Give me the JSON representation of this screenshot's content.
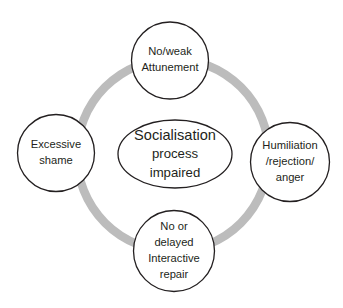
{
  "diagram": {
    "type": "cycle-diagram",
    "colors": {
      "ring": "#bcbcbc",
      "node_stroke": "#231f20",
      "node_fill": "#ffffff",
      "text": "#231f20",
      "background": "#ffffff"
    },
    "center": {
      "name": "socialisation-process-impaired",
      "shape": "ellipse",
      "lines": [
        "Socialisation",
        "process",
        "impaired"
      ]
    },
    "nodes": [
      {
        "id": "top",
        "name": "no-weak-attunement",
        "shape": "circle",
        "lines": [
          "No/weak",
          "Attunement"
        ]
      },
      {
        "id": "right",
        "name": "humiliation-rejection-anger",
        "shape": "circle",
        "lines": [
          "Humiliation",
          "/rejection/",
          "anger"
        ]
      },
      {
        "id": "bottom",
        "name": "no-or-delayed-interactive-repair",
        "shape": "circle",
        "lines": [
          "No or",
          "delayed",
          "Interactive",
          "repair"
        ]
      },
      {
        "id": "left",
        "name": "excessive-shame",
        "shape": "circle",
        "lines": [
          "Excessive",
          "shame"
        ]
      }
    ]
  }
}
